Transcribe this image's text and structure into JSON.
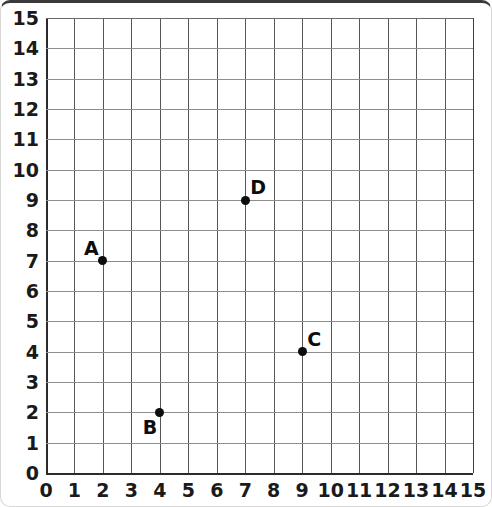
{
  "chart_data": {
    "type": "scatter",
    "title": "",
    "xlabel": "",
    "ylabel": "",
    "xlim": [
      0,
      15
    ],
    "ylim": [
      0,
      15
    ],
    "grid": true,
    "legend": "none",
    "x_ticks": [
      "0",
      "1",
      "2",
      "3",
      "4",
      "5",
      "6",
      "7",
      "8",
      "9",
      "10",
      "11",
      "12",
      "13",
      "14",
      "15"
    ],
    "y_ticks": [
      "0",
      "1",
      "2",
      "3",
      "4",
      "5",
      "6",
      "7",
      "8",
      "9",
      "10",
      "11",
      "12",
      "13",
      "14",
      "15"
    ],
    "points": [
      {
        "label": "A",
        "x": 2,
        "y": 7,
        "label_position": "top-left"
      },
      {
        "label": "B",
        "x": 4,
        "y": 2,
        "label_position": "bottom-left"
      },
      {
        "label": "C",
        "x": 9,
        "y": 4,
        "label_position": "top-right"
      },
      {
        "label": "D",
        "x": 7,
        "y": 9,
        "label_position": "top-right"
      }
    ],
    "colors": {
      "point": "#0d0d0d",
      "vertical_gridline": "#565656",
      "horizontal_gridline": "#8d8d8d",
      "axis": "#2b2b2b",
      "label": "#1a1a1a",
      "background": "#ffffff"
    }
  }
}
